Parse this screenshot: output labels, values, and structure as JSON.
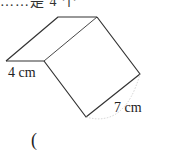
{
  "header": {
    "cut_off_text": "……是 4 个"
  },
  "figure": {
    "shape": "triangular-prism-like solid (slanted top face with square front face)",
    "labels": {
      "short_edge": "4 cm",
      "long_edge": "7 cm"
    },
    "colors": {
      "line": "#333333",
      "arc": "#c8c8c8"
    }
  },
  "answer": {
    "open_paren": "("
  }
}
